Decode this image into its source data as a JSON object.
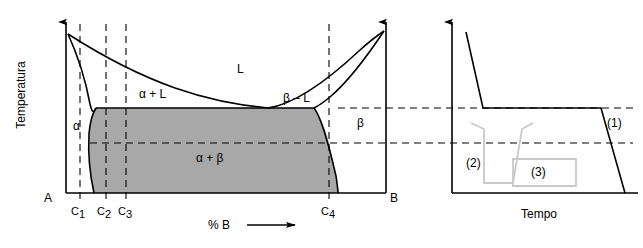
{
  "figure": {
    "axis_labels": {
      "y_left": "Temperatura",
      "x_left": "% B",
      "x_right": "Tempo"
    },
    "phase_diagram": {
      "endpoint_left": "A",
      "endpoint_right": "B",
      "regions": [
        {
          "id": "liquid",
          "label": "L"
        },
        {
          "id": "alpha-plus-liquid",
          "label": "α + L"
        },
        {
          "id": "beta-minus-liquid",
          "label": "β – L"
        },
        {
          "id": "alpha",
          "label": "α"
        },
        {
          "id": "beta",
          "label": "β"
        },
        {
          "id": "alpha-plus-beta",
          "label": "α + β"
        }
      ],
      "composition_ticks": [
        {
          "id": "c1",
          "label": "C",
          "sub": "1"
        },
        {
          "id": "c2",
          "label": "C",
          "sub": "2"
        },
        {
          "id": "c3",
          "label": "C",
          "sub": "3"
        },
        {
          "id": "c4",
          "label": "C",
          "sub": "4"
        }
      ]
    },
    "cooling_curves": {
      "labels": [
        {
          "id": "curve-1",
          "label": "(1)"
        },
        {
          "id": "curve-2",
          "label": "(2)"
        },
        {
          "id": "curve-3",
          "label": "(3)"
        }
      ]
    },
    "colors": {
      "fill_gray": "#a8a8a8",
      "line": "#000000",
      "curve_gray": "#c9c9c9"
    }
  }
}
